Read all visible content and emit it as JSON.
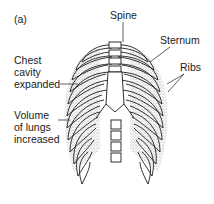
{
  "figure": {
    "panel_label": "(a)",
    "labels": {
      "spine": "Spine",
      "sternum": "Sternum",
      "ribs": "Ribs",
      "chest_line1": "Chest",
      "chest_line2": "cavity",
      "chest_line3": "expanded",
      "volume_line1": "Volume",
      "volume_line2": "of lungs",
      "volume_line3": "increased"
    },
    "colors": {
      "ink": "#1a1a1a",
      "background": "#ffffff",
      "stipple": "#9a9a9a"
    }
  }
}
